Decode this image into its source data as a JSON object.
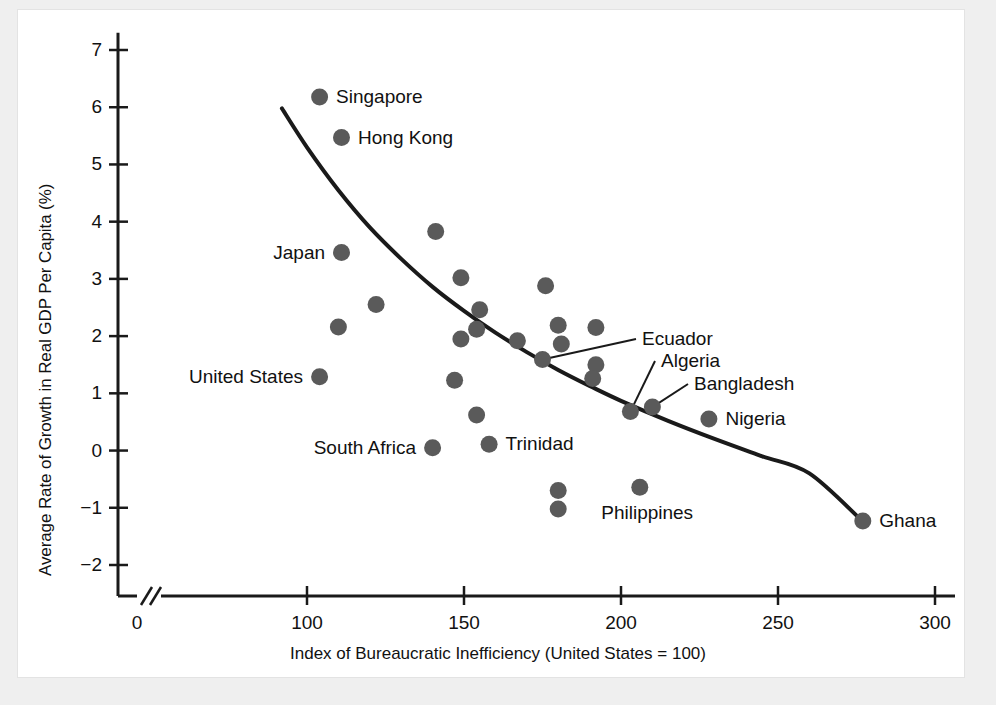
{
  "figure": {
    "background": "#efefef",
    "panel_background": "#ffffff",
    "ink_color": "#1a1a1a",
    "marker_color": "#5a5a5a"
  },
  "chart_data": {
    "type": "scatter",
    "title": "",
    "xlabel": "Index of Bureaucratic Inefficiency (United States = 100)",
    "ylabel": "Average Rate of Growth in Real GDP Per Capita (%)",
    "xlim": [
      90,
      305
    ],
    "ylim": [
      -2.4,
      7.2
    ],
    "xticks": [
      0,
      100,
      150,
      200,
      250,
      300
    ],
    "xtick_labels": [
      "0",
      "100",
      "150",
      "200",
      "250",
      "300"
    ],
    "yticks": [
      -2,
      -1,
      0,
      1,
      2,
      3,
      4,
      5,
      6,
      7
    ],
    "ytick_labels": [
      "−2",
      "−1",
      "0",
      "1",
      "2",
      "3",
      "4",
      "5",
      "6",
      "7"
    ],
    "axis_break": true,
    "axis_break_note": "double slash break on x-axis between 0 and 100",
    "grid": false,
    "legend": null,
    "points": [
      {
        "label": "Singapore",
        "x": 104,
        "y": 6.18,
        "label_pos": "right"
      },
      {
        "label": "Hong Kong",
        "x": 111,
        "y": 5.47,
        "label_pos": "right"
      },
      {
        "label": "",
        "x": 141,
        "y": 3.83,
        "label_pos": "none"
      },
      {
        "label": "Japan",
        "x": 111,
        "y": 3.46,
        "label_pos": "left"
      },
      {
        "label": "",
        "x": 149,
        "y": 3.02,
        "label_pos": "none"
      },
      {
        "label": "",
        "x": 176,
        "y": 2.88,
        "label_pos": "none"
      },
      {
        "label": "",
        "x": 122,
        "y": 2.55,
        "label_pos": "none"
      },
      {
        "label": "",
        "x": 155,
        "y": 2.46,
        "label_pos": "none"
      },
      {
        "label": "",
        "x": 180,
        "y": 2.19,
        "label_pos": "none"
      },
      {
        "label": "",
        "x": 110,
        "y": 2.16,
        "label_pos": "none"
      },
      {
        "label": "",
        "x": 192,
        "y": 2.15,
        "label_pos": "none"
      },
      {
        "label": "",
        "x": 154,
        "y": 2.12,
        "label_pos": "none"
      },
      {
        "label": "",
        "x": 149,
        "y": 1.95,
        "label_pos": "none"
      },
      {
        "label": "",
        "x": 167,
        "y": 1.92,
        "label_pos": "none"
      },
      {
        "label": "",
        "x": 181,
        "y": 1.86,
        "label_pos": "none"
      },
      {
        "label": "Ecuador",
        "x": 175,
        "y": 1.59,
        "label_pos": "leader"
      },
      {
        "label": "",
        "x": 192,
        "y": 1.5,
        "label_pos": "none"
      },
      {
        "label": "United States",
        "x": 104,
        "y": 1.29,
        "label_pos": "left"
      },
      {
        "label": "",
        "x": 191,
        "y": 1.26,
        "label_pos": "none"
      },
      {
        "label": "",
        "x": 147,
        "y": 1.23,
        "label_pos": "none"
      },
      {
        "label": "Bangladesh",
        "x": 210,
        "y": 0.76,
        "label_pos": "leader"
      },
      {
        "label": "Algeria",
        "x": 203,
        "y": 0.68,
        "label_pos": "leader"
      },
      {
        "label": "",
        "x": 154,
        "y": 0.62,
        "label_pos": "none"
      },
      {
        "label": "Nigeria",
        "x": 228,
        "y": 0.55,
        "label_pos": "right"
      },
      {
        "label": "Trinidad",
        "x": 158,
        "y": 0.11,
        "label_pos": "right"
      },
      {
        "label": "South Africa",
        "x": 140,
        "y": 0.05,
        "label_pos": "left"
      },
      {
        "label": "Philippines",
        "x": 206,
        "y": -0.64,
        "label_pos": "below"
      },
      {
        "label": "",
        "x": 180,
        "y": -0.7,
        "label_pos": "none"
      },
      {
        "label": "",
        "x": 180,
        "y": -1.02,
        "label_pos": "none"
      },
      {
        "label": "Ghana",
        "x": 277,
        "y": -1.23,
        "label_pos": "right"
      }
    ],
    "fit_curve": {
      "description": "downward-sloping convex trend curve",
      "points": [
        {
          "x": 92,
          "y": 5.98
        },
        {
          "x": 100,
          "y": 5.3
        },
        {
          "x": 110,
          "y": 4.55
        },
        {
          "x": 120,
          "y": 3.9
        },
        {
          "x": 130,
          "y": 3.35
        },
        {
          "x": 140,
          "y": 2.86
        },
        {
          "x": 150,
          "y": 2.44
        },
        {
          "x": 160,
          "y": 2.06
        },
        {
          "x": 170,
          "y": 1.72
        },
        {
          "x": 180,
          "y": 1.41
        },
        {
          "x": 190,
          "y": 1.13
        },
        {
          "x": 200,
          "y": 0.87
        },
        {
          "x": 215,
          "y": 0.52
        },
        {
          "x": 230,
          "y": 0.2
        },
        {
          "x": 245,
          "y": -0.1
        },
        {
          "x": 260,
          "y": -0.4
        },
        {
          "x": 277,
          "y": -1.24
        }
      ]
    }
  },
  "axis": {
    "x_title": "Index of Bureaucratic Inefficiency (United States = 100)",
    "y_title": "Average Rate of Growth in Real GDP Per Capita (%)"
  }
}
